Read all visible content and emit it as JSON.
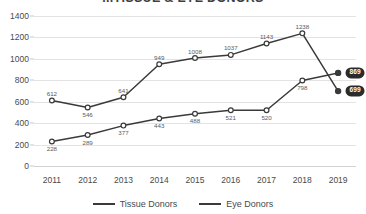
{
  "chart_data": {
    "type": "line",
    "title": "...TISSUE & EYE DONORS",
    "xlabel": "",
    "ylabel": "",
    "categories": [
      "2011",
      "2012",
      "2013",
      "2014",
      "2015",
      "2016",
      "2017",
      "2018",
      "2019"
    ],
    "ylim": [
      0,
      1400
    ],
    "yticks": [
      0,
      200,
      400,
      600,
      800,
      1000,
      1200,
      1400
    ],
    "grid": true,
    "legend_position": "bottom",
    "series": [
      {
        "name": "Tissue Donors",
        "color": "#3a3a3a",
        "marker": "open-circle",
        "values": [
          228,
          289,
          377,
          443,
          488,
          521,
          520,
          798,
          869
        ],
        "point_labels": [
          "228",
          "289",
          "377",
          "443",
          "488",
          "521",
          "520",
          "798",
          ""
        ],
        "end_badge": "869"
      },
      {
        "name": "Eye Donors",
        "color": "#3a3a3a",
        "marker": "open-circle",
        "values": [
          612,
          546,
          641,
          949,
          1008,
          1037,
          1143,
          1238,
          699
        ],
        "point_labels": [
          "612",
          "546",
          "641",
          "949",
          "1008",
          "1037",
          "1143",
          "1238",
          ""
        ],
        "end_badge": "699"
      }
    ]
  },
  "legend": {
    "items": [
      {
        "label": "Tissue Donors"
      },
      {
        "label": "Eye Donors"
      }
    ]
  },
  "yticklabels": [
    "1400",
    "1200",
    "1000",
    "800",
    "600",
    "400",
    "200",
    "0"
  ]
}
